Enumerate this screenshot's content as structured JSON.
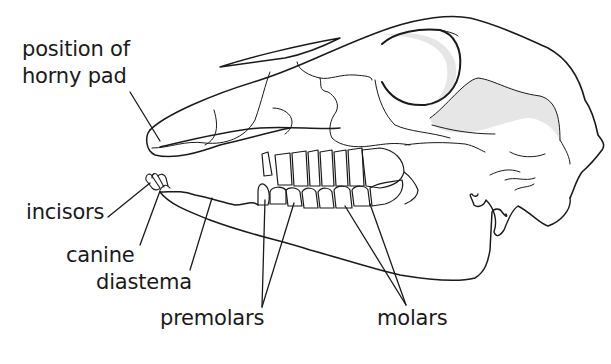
{
  "diagram": {
    "colors": {
      "line": "#1a1a1a",
      "shade": "#e6e6e6",
      "background": "#ffffff"
    },
    "labels": [
      {
        "id": "horny-pad",
        "text_line1": "position of",
        "text_line2": "horny pad"
      },
      {
        "id": "incisors",
        "text": "incisors"
      },
      {
        "id": "canine",
        "text": "canine"
      },
      {
        "id": "diastema",
        "text": "diastema"
      },
      {
        "id": "premolars",
        "text": "premolars"
      },
      {
        "id": "molars",
        "text": "molars"
      }
    ]
  }
}
